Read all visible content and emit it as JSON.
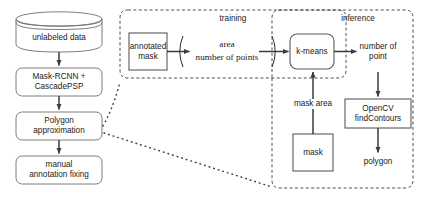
{
  "diagram": {
    "stroke_dark": "#3b3b3b",
    "stroke_gray": "#6f6f6f",
    "text_color": "#1a1a1a",
    "background": "#ffffff"
  },
  "pipeline": {
    "datastore": {
      "label": "unlabeled data",
      "shape": "cylinder"
    },
    "steps": [
      {
        "label": "Mask-RCNN +\nCascadePSP",
        "shape": "rounded-rect"
      },
      {
        "label": "Polygon\napproximation",
        "shape": "rounded-rect"
      },
      {
        "label": "manual\nannotation fixing",
        "shape": "rounded-rect"
      }
    ]
  },
  "regions": {
    "training": {
      "label": "training",
      "style": "dashed"
    },
    "inference": {
      "label": "inference",
      "style": "dashed"
    }
  },
  "training": {
    "annotated_mask": {
      "label": "annotated\nmask",
      "shape": "rect"
    },
    "ratio": {
      "numerator": "area",
      "denominator": "number of points",
      "grouping": "parentheses"
    },
    "kmeans": {
      "label": "k-means",
      "shape": "rounded-rect"
    }
  },
  "inference": {
    "number_of_point": {
      "label": "number of\npoint",
      "shape": "text"
    },
    "opencv": {
      "label": "OpenCV\nfindContours",
      "shape": "rect"
    },
    "polygon": {
      "label": "polygon",
      "shape": "text"
    },
    "mask": {
      "label": "mask",
      "shape": "rect"
    },
    "mask_area": {
      "label": "mask area",
      "shape": "edge-label"
    }
  }
}
